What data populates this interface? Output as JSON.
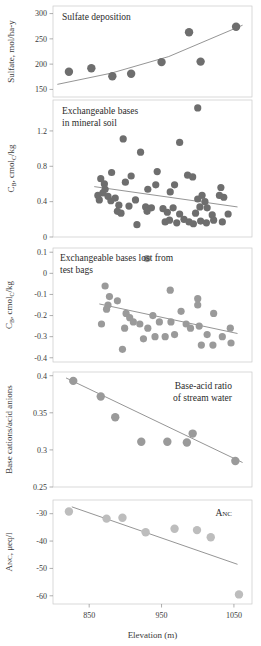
{
  "figure": {
    "xlabel": "Elevation (m)",
    "xticks": [
      850,
      950,
      1050
    ],
    "xlim": [
      800,
      1075
    ],
    "marker_color_dark": "#6e6e6e",
    "marker_color_mid": "#9a9a9a",
    "marker_color_light": "#bdbdbd",
    "trend_color": "#7a7a7a",
    "frame_color": "#c9c9c9"
  },
  "panels": [
    {
      "id": "sulfate-deposition",
      "title": "Sulfate deposition",
      "title_lines": [
        "Sulfate deposition"
      ],
      "ylabel": "Sulfate, mol/ha-y",
      "yticks": [
        150,
        200,
        250,
        300
      ],
      "ylim": [
        135,
        315
      ],
      "trend_type": "curve"
    },
    {
      "id": "exchangeable-bases-mineral-soil",
      "title": "Exchangeable bases in mineral soil",
      "title_lines": [
        "Exchangeable bases",
        "in mineral soil"
      ],
      "ylabel": "CB, cmolC/kg",
      "yticks": [
        0,
        0.4,
        0.8,
        1.2
      ],
      "ylim": [
        0,
        1.55
      ],
      "trend_type": "line"
    },
    {
      "id": "exchangeable-bases-lost-test-bags",
      "title": "Exchangeable bases lost from test bags",
      "title_lines": [
        "Exchangeable bases lost from",
        "test bags"
      ],
      "ylabel": "CB, cmolC/kg",
      "yticks": [
        -0.4,
        -0.3,
        -0.2,
        -0.1,
        0,
        0.1
      ],
      "ylim": [
        -0.42,
        0.12
      ],
      "trend_type": "line"
    },
    {
      "id": "base-acid-ratio-stream-water",
      "title": "Base-acid ratio of stream water",
      "title_lines": [
        "Base-acid ratio",
        "of stream water"
      ],
      "ylabel": "Base cations/acid anions",
      "yticks": [
        0.25,
        0.3,
        0.35,
        0.4
      ],
      "ylim": [
        0.25,
        0.405
      ],
      "trend_type": "line"
    },
    {
      "id": "anc",
      "title": "ANC",
      "title_lines": [
        "ANC"
      ],
      "ylabel": "ANC, μeq/l",
      "yticks": [
        -60,
        -50,
        -40,
        -30
      ],
      "ylim": [
        -63,
        -25
      ],
      "trend_type": "line"
    }
  ],
  "chart_data": [
    {
      "type": "scatter",
      "title": "Sulfate deposition",
      "xlabel": "Elevation (m)",
      "ylabel": "Sulfate, mol/ha-y",
      "xlim": [
        800,
        1075
      ],
      "ylim": [
        135,
        315
      ],
      "yticks": [
        150,
        200,
        250,
        300
      ],
      "grid": false,
      "legend": "none",
      "points": [
        {
          "x": 822,
          "y": 185
        },
        {
          "x": 853,
          "y": 192
        },
        {
          "x": 882,
          "y": 176
        },
        {
          "x": 908,
          "y": 181
        },
        {
          "x": 950,
          "y": 204
        },
        {
          "x": 988,
          "y": 263
        },
        {
          "x": 1004,
          "y": 205
        },
        {
          "x": 1053,
          "y": 274
        }
      ],
      "trendline": {
        "kind": "curve",
        "x": [
          806,
          880,
          960,
          1062
        ],
        "y": [
          160,
          182,
          215,
          277
        ]
      }
    },
    {
      "type": "scatter",
      "title": "Exchangeable bases in mineral soil",
      "xlabel": "Elevation (m)",
      "ylabel": "CB, cmolC/kg",
      "xlim": [
        800,
        1075
      ],
      "ylim": [
        0,
        1.55
      ],
      "yticks": [
        0,
        0.4,
        0.8,
        1.2
      ],
      "grid": false,
      "legend": "none",
      "points": [
        {
          "x": 1000,
          "y": 1.46
        },
        {
          "x": 897,
          "y": 1.11
        },
        {
          "x": 975,
          "y": 1.07
        },
        {
          "x": 921,
          "y": 0.96
        },
        {
          "x": 881,
          "y": 0.73
        },
        {
          "x": 944,
          "y": 0.74
        },
        {
          "x": 866,
          "y": 0.66
        },
        {
          "x": 908,
          "y": 0.69
        },
        {
          "x": 986,
          "y": 0.7
        },
        {
          "x": 993,
          "y": 0.68
        },
        {
          "x": 871,
          "y": 0.6
        },
        {
          "x": 900,
          "y": 0.62
        },
        {
          "x": 942,
          "y": 0.59
        },
        {
          "x": 968,
          "y": 0.59
        },
        {
          "x": 872,
          "y": 0.54
        },
        {
          "x": 869,
          "y": 0.5
        },
        {
          "x": 931,
          "y": 0.54
        },
        {
          "x": 962,
          "y": 0.51
        },
        {
          "x": 1032,
          "y": 0.56
        },
        {
          "x": 862,
          "y": 0.47
        },
        {
          "x": 876,
          "y": 0.46
        },
        {
          "x": 886,
          "y": 0.44
        },
        {
          "x": 1006,
          "y": 0.47
        },
        {
          "x": 1030,
          "y": 0.47
        },
        {
          "x": 1036,
          "y": 0.45
        },
        {
          "x": 864,
          "y": 0.42
        },
        {
          "x": 880,
          "y": 0.41
        },
        {
          "x": 914,
          "y": 0.42
        },
        {
          "x": 1000,
          "y": 0.43
        },
        {
          "x": 1010,
          "y": 0.4
        },
        {
          "x": 891,
          "y": 0.36
        },
        {
          "x": 905,
          "y": 0.35
        },
        {
          "x": 928,
          "y": 0.34
        },
        {
          "x": 936,
          "y": 0.33
        },
        {
          "x": 952,
          "y": 0.32
        },
        {
          "x": 966,
          "y": 0.33
        },
        {
          "x": 1003,
          "y": 0.34
        },
        {
          "x": 1013,
          "y": 0.33
        },
        {
          "x": 889,
          "y": 0.29
        },
        {
          "x": 894,
          "y": 0.27
        },
        {
          "x": 930,
          "y": 0.29
        },
        {
          "x": 958,
          "y": 0.28
        },
        {
          "x": 975,
          "y": 0.26
        },
        {
          "x": 997,
          "y": 0.27
        },
        {
          "x": 1020,
          "y": 0.25
        },
        {
          "x": 1042,
          "y": 0.26
        },
        {
          "x": 916,
          "y": 0.14
        },
        {
          "x": 955,
          "y": 0.17
        },
        {
          "x": 961,
          "y": 0.19
        },
        {
          "x": 971,
          "y": 0.16
        },
        {
          "x": 981,
          "y": 0.2
        },
        {
          "x": 988,
          "y": 0.17
        },
        {
          "x": 994,
          "y": 0.15
        },
        {
          "x": 1004,
          "y": 0.18
        },
        {
          "x": 1012,
          "y": 0.16
        },
        {
          "x": 1022,
          "y": 0.19
        },
        {
          "x": 1034,
          "y": 0.17
        }
      ],
      "trendline": {
        "kind": "line",
        "x": [
          857,
          1055
        ],
        "y": [
          0.57,
          0.34
        ]
      }
    },
    {
      "type": "scatter",
      "title": "Exchangeable bases lost from test bags",
      "xlabel": "Elevation (m)",
      "ylabel": "CB, cmolC/kg",
      "xlim": [
        800,
        1075
      ],
      "ylim": [
        -0.42,
        0.12
      ],
      "yticks": [
        -0.4,
        -0.3,
        -0.2,
        -0.1,
        0,
        0.1
      ],
      "grid": false,
      "legend": "none",
      "points": [
        {
          "x": 930,
          "y": 0.07
        },
        {
          "x": 872,
          "y": -0.06
        },
        {
          "x": 962,
          "y": -0.08
        },
        {
          "x": 878,
          "y": -0.11
        },
        {
          "x": 889,
          "y": -0.13
        },
        {
          "x": 1000,
          "y": -0.12
        },
        {
          "x": 1000,
          "y": -0.15
        },
        {
          "x": 874,
          "y": -0.17
        },
        {
          "x": 876,
          "y": -0.15
        },
        {
          "x": 901,
          "y": -0.19
        },
        {
          "x": 906,
          "y": -0.21
        },
        {
          "x": 938,
          "y": -0.2
        },
        {
          "x": 977,
          "y": -0.18
        },
        {
          "x": 867,
          "y": -0.24
        },
        {
          "x": 911,
          "y": -0.23
        },
        {
          "x": 920,
          "y": -0.24
        },
        {
          "x": 947,
          "y": -0.23
        },
        {
          "x": 963,
          "y": -0.23
        },
        {
          "x": 984,
          "y": -0.24
        },
        {
          "x": 1022,
          "y": -0.19
        },
        {
          "x": 899,
          "y": -0.26
        },
        {
          "x": 931,
          "y": -0.26
        },
        {
          "x": 990,
          "y": -0.26
        },
        {
          "x": 1002,
          "y": -0.25
        },
        {
          "x": 1045,
          "y": -0.26
        },
        {
          "x": 925,
          "y": -0.31
        },
        {
          "x": 941,
          "y": -0.3
        },
        {
          "x": 955,
          "y": -0.3
        },
        {
          "x": 968,
          "y": -0.29
        },
        {
          "x": 1013,
          "y": -0.29
        },
        {
          "x": 1034,
          "y": -0.3
        },
        {
          "x": 1005,
          "y": -0.34
        },
        {
          "x": 1021,
          "y": -0.34
        },
        {
          "x": 1046,
          "y": -0.33
        },
        {
          "x": 896,
          "y": -0.36
        }
      ],
      "trendline": {
        "kind": "line",
        "x": [
          864,
          1055
        ],
        "y": [
          -0.145,
          -0.285
        ]
      }
    },
    {
      "type": "scatter",
      "title": "Base-acid ratio of stream water",
      "xlabel": "Elevation (m)",
      "ylabel": "Base cations/acid anions",
      "xlim": [
        800,
        1075
      ],
      "ylim": [
        0.25,
        0.405
      ],
      "yticks": [
        0.25,
        0.3,
        0.35,
        0.4
      ],
      "grid": false,
      "legend": "none",
      "points": [
        {
          "x": 828,
          "y": 0.393
        },
        {
          "x": 866,
          "y": 0.372
        },
        {
          "x": 886,
          "y": 0.344
        },
        {
          "x": 922,
          "y": 0.311
        },
        {
          "x": 958,
          "y": 0.311
        },
        {
          "x": 985,
          "y": 0.31
        },
        {
          "x": 993,
          "y": 0.322
        },
        {
          "x": 1052,
          "y": 0.285
        }
      ],
      "trendline": {
        "kind": "line",
        "x": [
          818,
          1062
        ],
        "y": [
          0.397,
          0.283
        ]
      }
    },
    {
      "type": "scatter",
      "title": "ANC",
      "xlabel": "Elevation (m)",
      "ylabel": "ANC, μeq/l",
      "xlim": [
        800,
        1075
      ],
      "ylim": [
        -63,
        -25
      ],
      "yticks": [
        -60,
        -50,
        -40,
        -30
      ],
      "grid": false,
      "legend": "none",
      "points": [
        {
          "x": 822,
          "y": -29.2
        },
        {
          "x": 874,
          "y": -31.8
        },
        {
          "x": 896,
          "y": -31.5
        },
        {
          "x": 928,
          "y": -36.8
        },
        {
          "x": 968,
          "y": -35.5
        },
        {
          "x": 999,
          "y": -36.0
        },
        {
          "x": 1018,
          "y": -38.6
        },
        {
          "x": 1057,
          "y": -59.5
        }
      ],
      "trendline": {
        "kind": "line",
        "x": [
          826,
          1055
        ],
        "y": [
          -27.5,
          -48.5
        ]
      }
    }
  ]
}
